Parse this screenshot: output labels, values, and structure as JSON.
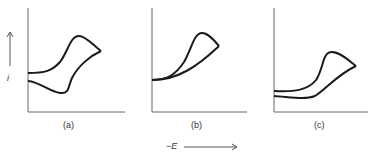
{
  "figure": {
    "y_axis_label": "i",
    "x_axis_label": "−E",
    "panels": [
      {
        "id": "a",
        "label": "(a)"
      },
      {
        "id": "b",
        "label": "(b)"
      },
      {
        "id": "c",
        "label": "(c)"
      }
    ]
  },
  "colors": {
    "stroke": "#1a1a1a",
    "axis": "#555555"
  }
}
